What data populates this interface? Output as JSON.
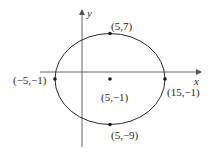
{
  "diagram": {
    "type": "ellipse-graph",
    "axes": {
      "x_label": "x",
      "y_label": "y"
    },
    "colors": {
      "stroke": "#2a2a2a",
      "axis": "#555555",
      "background": "#ffffff"
    },
    "ellipse": {
      "center_label": "(5,−1)",
      "top_label": "(5,7)",
      "bottom_label": "(5,−9)",
      "left_label": "(−5,−1)",
      "right_label": "(15,−1)"
    },
    "points": [
      {
        "name": "center",
        "label": "(5,−1)"
      },
      {
        "name": "top-vertex",
        "label": "(5,7)"
      },
      {
        "name": "bottom-vertex",
        "label": "(5,−9)"
      },
      {
        "name": "left-vertex",
        "label": "(−5,−1)"
      },
      {
        "name": "right-vertex",
        "label": "(15,−1)"
      }
    ]
  }
}
